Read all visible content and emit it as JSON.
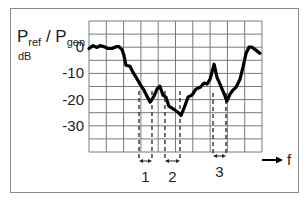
{
  "chart_data": {
    "type": "line",
    "title": "",
    "ylabel_main": "P",
    "ylabel_ref_sub": "ref",
    "ylabel_sep": " / P",
    "ylabel_gen_sub": "gen",
    "yunit": "dB",
    "xlabel": "f",
    "ylim": [
      -40,
      10
    ],
    "xlim": [
      0,
      10
    ],
    "grid": true,
    "grid_rows": 10,
    "grid_cols": 10,
    "y_ticks": [
      {
        "value": 0,
        "label": "0"
      },
      {
        "value": -10,
        "label": "-10"
      },
      {
        "value": -20,
        "label": "-20"
      },
      {
        "value": -30,
        "label": "-30"
      }
    ],
    "series": [
      {
        "name": "Pref/Pgen",
        "color": "#000000",
        "x": [
          0.0,
          0.23,
          0.46,
          0.64,
          0.87,
          1.1,
          1.33,
          1.56,
          1.73,
          1.91,
          2.02,
          2.14,
          2.37,
          2.54,
          2.72,
          2.95,
          3.18,
          3.35,
          3.53,
          3.76,
          3.93,
          4.1,
          4.28,
          4.45,
          4.62,
          4.91,
          5.14,
          5.32,
          5.49,
          5.72,
          5.95,
          6.18,
          6.42,
          6.65,
          6.82,
          7.0,
          7.11,
          7.23,
          7.4,
          7.57,
          7.8,
          7.97,
          8.15,
          8.32,
          8.5,
          8.73,
          8.9,
          9.08,
          9.25,
          9.42,
          9.65,
          9.88
        ],
        "y": [
          -0.5,
          0.6,
          -0.1,
          0.6,
          0.2,
          -0.5,
          -0.5,
          0.2,
          0.2,
          -0.9,
          -3.1,
          -6.9,
          -7.3,
          -9.5,
          -11.5,
          -14.1,
          -16.4,
          -18.7,
          -21.0,
          -18.7,
          -16.0,
          -14.9,
          -18.3,
          -19.1,
          -22.5,
          -23.7,
          -24.8,
          -26.0,
          -23.3,
          -19.1,
          -18.3,
          -16.0,
          -15.3,
          -13.7,
          -14.1,
          -12.2,
          -9.5,
          -6.5,
          -11.5,
          -14.1,
          -17.6,
          -20.6,
          -17.9,
          -16.4,
          -15.3,
          -12.2,
          -7.6,
          -2.3,
          0.0,
          0.0,
          -1.1,
          -2.3
        ]
      }
    ],
    "bands": [
      {
        "label": "1",
        "x_start": 2.89,
        "x_end": 3.64
      },
      {
        "label": "2",
        "x_start": 4.39,
        "x_end": 5.26
      },
      {
        "label": "3",
        "x_start": 7.17,
        "x_end": 7.92
      }
    ]
  }
}
